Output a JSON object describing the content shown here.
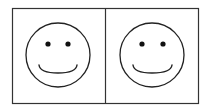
{
  "diagram": {
    "title": "",
    "panels": [
      {
        "id": "left",
        "face": "smiley",
        "expression": "happy"
      },
      {
        "id": "right",
        "face": "smiley",
        "expression": "happy"
      }
    ],
    "colors": {
      "stroke": "#222222",
      "background": "#ffffff"
    }
  }
}
